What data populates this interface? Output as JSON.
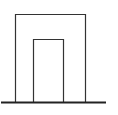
{
  "diagram": {
    "stroke_color": "#333333",
    "background": "#ffffff",
    "outer_frame": {
      "x1": 15,
      "y_top": 14,
      "x2": 86,
      "y_bottom": 102
    },
    "inner_frame": {
      "x1": 33,
      "y_top": 39,
      "x2": 64,
      "y_bottom": 102
    },
    "ground_line": {
      "x1": 1,
      "x2": 106,
      "y": 102
    }
  }
}
